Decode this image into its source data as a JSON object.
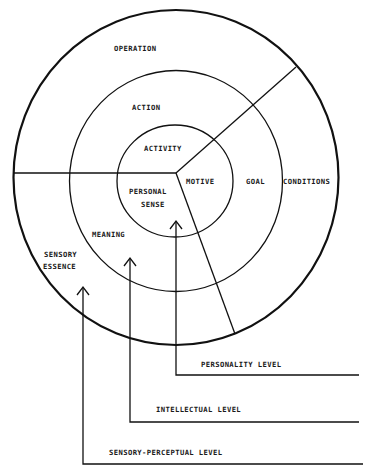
{
  "diagram": {
    "rings": {
      "outer": "OPERATION",
      "middle": "ACTION",
      "inner": "ACTIVITY"
    },
    "right_sector": {
      "inner": "MOTIVE",
      "middle": "GOAL",
      "outer": "CONDITIONS"
    },
    "lower_sector": {
      "inner_line1": "PERSONAL",
      "inner_line2": "SENSE",
      "middle": "MEANING",
      "outer_line1": "SENSORY",
      "outer_line2": "ESSENCE"
    },
    "levels": [
      {
        "label": "PERSONALITY LEVEL"
      },
      {
        "label": "INTELLECTUAL LEVEL"
      },
      {
        "label": "SENSORY-PERCEPTUAL LEVEL"
      }
    ]
  }
}
